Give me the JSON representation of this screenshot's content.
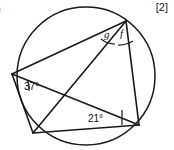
{
  "question": {
    "number": ")",
    "marks": "[2]"
  },
  "figure": {
    "type": "circle-geometry-diagram",
    "circle": {
      "cx": 86,
      "cy": 76,
      "r": 69,
      "stroke": "#1a1a1a"
    },
    "stroke_color": "#1a1a1a",
    "background": "#ffffff",
    "points": {
      "top": {
        "x": 126,
        "y": 21
      },
      "left": {
        "x": 12,
        "y": 74
      },
      "bottom_left": {
        "x": 33,
        "y": 133
      },
      "right": {
        "x": 139,
        "y": 125
      }
    },
    "chords": [
      {
        "from": "top",
        "to": "left"
      },
      {
        "from": "top",
        "to": "bottom_left"
      },
      {
        "from": "top",
        "to": "right"
      },
      {
        "from": "left",
        "to": "bottom_left"
      },
      {
        "from": "left",
        "to": "right"
      },
      {
        "from": "bottom_left",
        "to": "right"
      }
    ],
    "angles": [
      {
        "id": "angle-37",
        "label": "37°",
        "value": 37,
        "vertex": "left",
        "known": true
      },
      {
        "id": "angle-21",
        "label": "21°",
        "value": 21,
        "vertex": "right",
        "known": true
      },
      {
        "id": "angle-g",
        "label": "g",
        "vertex": "top",
        "known": false
      },
      {
        "id": "angle-f",
        "label": "f",
        "vertex": "top",
        "known": false
      }
    ]
  }
}
